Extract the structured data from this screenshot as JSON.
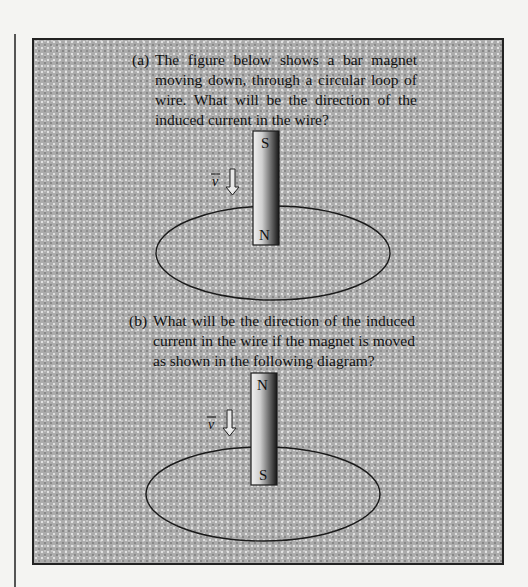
{
  "problem": {
    "part_a": {
      "label": "(a)",
      "text": "The figure below shows a bar magnet moving down, through a circular loop of wire. What will be the direction of the induced current in the wire?",
      "figure": {
        "magnet_top_pole": "S",
        "magnet_bottom_pole": "N",
        "velocity_label": "v",
        "velocity_direction": "down"
      }
    },
    "part_b": {
      "label": "(b)",
      "text": "What will be the direction of the induced current in the wire if the magnet is moved as shown in the following diagram?",
      "figure": {
        "magnet_top_pole": "N",
        "magnet_bottom_pole": "S",
        "velocity_label": "v",
        "velocity_direction": "down"
      }
    }
  },
  "colors": {
    "page_background": "#f4f4f2",
    "box_background": "#ababab",
    "border": "#222222",
    "text": "#111111"
  }
}
